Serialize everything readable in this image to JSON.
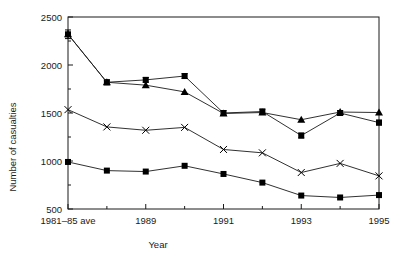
{
  "chart_data": {
    "type": "line",
    "title": "",
    "xlabel": "Year",
    "ylabel": "Number of casualties",
    "ylim": [
      500,
      2500
    ],
    "ytick_values": [
      500,
      1000,
      1500,
      2000,
      2500
    ],
    "ytick_labels": [
      "500",
      "1000",
      "1500",
      "2000",
      "2500"
    ],
    "yminor_step": 250,
    "grid": false,
    "legend": "none",
    "x": [
      0,
      1,
      2,
      3,
      4,
      5,
      6,
      7,
      8
    ],
    "categories": [
      "1981–85 ave",
      "",
      "1989",
      "",
      "1991",
      "",
      "1993",
      "",
      "1995"
    ],
    "xtick_labels_shown": [
      "1981–85 ave",
      "1989",
      "1991",
      "1993",
      "1995"
    ],
    "xtick_label_positions": [
      0,
      2,
      4,
      6,
      8
    ],
    "series": [
      {
        "name": "series-square-error",
        "marker": "square",
        "errorbars": true,
        "values": [
          2320,
          1820,
          1845,
          1885,
          1500,
          1515,
          1265,
          1500,
          1400
        ],
        "errors": [
          45,
          25,
          25,
          25,
          25,
          25,
          25,
          25,
          25
        ]
      },
      {
        "name": "series-triangle",
        "marker": "triangle",
        "errorbars": false,
        "values": [
          2320,
          1820,
          1790,
          1720,
          1495,
          1505,
          1430,
          1510,
          1505
        ]
      },
      {
        "name": "series-cross",
        "marker": "cross",
        "errorbars": false,
        "values": [
          1535,
          1355,
          1320,
          1350,
          1120,
          1085,
          880,
          975,
          845
        ]
      },
      {
        "name": "series-square-plain",
        "marker": "square-filled",
        "errorbars": false,
        "values": [
          990,
          900,
          890,
          950,
          865,
          775,
          640,
          620,
          645
        ]
      }
    ],
    "colors": {
      "line": "#1a1a1a",
      "marker": "#000000",
      "axis": "#1a1a1a",
      "background": "#ffffff"
    }
  }
}
